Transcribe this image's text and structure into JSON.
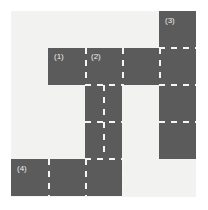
{
  "figure": {
    "type": "street-grid-diagram",
    "width": 208,
    "height": 210,
    "background_color": "#ffffff",
    "road_color": "#5b5b5b",
    "block_color": "#f2f2f0",
    "lane_marking_color": "#f5f5f3"
  },
  "grid": {
    "origin_x": 11,
    "origin_y": 11,
    "columns": 5,
    "rows": 5,
    "cell_size": 37,
    "note": "cell type map: R = road, B = block",
    "map": [
      [
        "B",
        "B",
        "B",
        "B",
        "R"
      ],
      [
        "B",
        "R",
        "R",
        "R",
        "R"
      ],
      [
        "B",
        "B",
        "R",
        "B",
        "R"
      ],
      [
        "B",
        "B",
        "R",
        "B",
        "R"
      ],
      [
        "R",
        "R",
        "R",
        "B",
        "B"
      ]
    ]
  },
  "labels": [
    {
      "id": "label-1",
      "text": "(1)",
      "x": 54,
      "y": 52
    },
    {
      "id": "label-2",
      "text": "(2)",
      "x": 91,
      "y": 52
    },
    {
      "id": "label-3",
      "text": "(3)",
      "x": 165,
      "y": 16
    },
    {
      "id": "label-4",
      "text": "(4)",
      "x": 17,
      "y": 164
    }
  ],
  "lane_markings": {
    "horizontal": [
      {
        "x": 159,
        "y": 47,
        "length": 37
      },
      {
        "x": 85,
        "y": 84,
        "length": 37
      },
      {
        "x": 159,
        "y": 84,
        "length": 37
      },
      {
        "x": 85,
        "y": 121,
        "length": 37
      },
      {
        "x": 159,
        "y": 121,
        "length": 37
      },
      {
        "x": 85,
        "y": 158,
        "length": 37
      }
    ],
    "vertical": [
      {
        "x": 85,
        "y": 48,
        "length": 37
      },
      {
        "x": 122,
        "y": 48,
        "length": 37
      },
      {
        "x": 159,
        "y": 48,
        "length": 37
      },
      {
        "x": 103,
        "y": 85,
        "length": 36
      },
      {
        "x": 103,
        "y": 122,
        "length": 36
      },
      {
        "x": 48,
        "y": 159,
        "length": 37
      },
      {
        "x": 85,
        "y": 159,
        "length": 37
      },
      {
        "x": 122,
        "y": 159,
        "length": 37
      }
    ]
  }
}
